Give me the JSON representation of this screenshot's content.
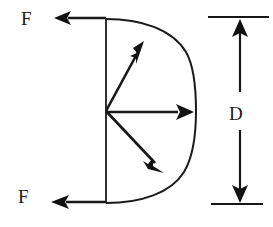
{
  "figure": {
    "background_color": "#ffffff",
    "ink_color": "#1a1a1a",
    "labels": {
      "force_top": "F",
      "force_bottom": "F",
      "diameter": "D"
    },
    "icon_names": {
      "arrowhead": "arrowhead-icon",
      "semicircle": "semicircle-arc-icon",
      "dimension": "dimension-line-icon"
    },
    "geometry": {
      "center": {
        "x": 106,
        "y": 111
      },
      "radius": 92,
      "arc_top": {
        "x": 106,
        "y": 19
      },
      "arc_right": {
        "x": 196,
        "y": 111
      },
      "arc_bottom": {
        "x": 106,
        "y": 203
      },
      "diameter_line": {
        "x": 106,
        "y1": 18,
        "y2": 203
      }
    },
    "radial_vectors": [
      {
        "name": "upper-diagonal-force",
        "from_x": 106,
        "from_y": 111,
        "to_x": 144,
        "to_y": 41,
        "angle_deg": 61
      },
      {
        "name": "horizontal-force",
        "from_x": 106,
        "from_y": 111,
        "to_x": 194,
        "to_y": 112,
        "angle_deg": 0
      },
      {
        "name": "lower-diagonal-force",
        "from_x": 106,
        "from_y": 111,
        "to_x": 164,
        "to_y": 173,
        "angle_deg": -47
      }
    ],
    "reaction_arrows": [
      {
        "name": "top-reaction-F",
        "from_x": 106,
        "from_y": 18,
        "to_x": 54,
        "to_y": 18,
        "direction": "left"
      },
      {
        "name": "bottom-reaction-F",
        "from_x": 106,
        "from_y": 202,
        "to_x": 51,
        "to_y": 202,
        "direction": "left"
      }
    ],
    "label_positions": {
      "force_top": {
        "x": 21,
        "y": 25
      },
      "force_bottom": {
        "x": 18,
        "y": 203
      },
      "diameter": {
        "x": 229,
        "y": 120
      }
    },
    "dimension": {
      "name": "diameter-dimension",
      "axis_x": 240,
      "top_extension": {
        "x1": 208,
        "x2": 269,
        "y": 17
      },
      "bottom_extension": {
        "x1": 211,
        "x2": 263,
        "y": 204
      },
      "upper_shaft": {
        "y1": 22,
        "y2": 92
      },
      "lower_shaft": {
        "y1": 130,
        "y2": 199
      }
    }
  }
}
